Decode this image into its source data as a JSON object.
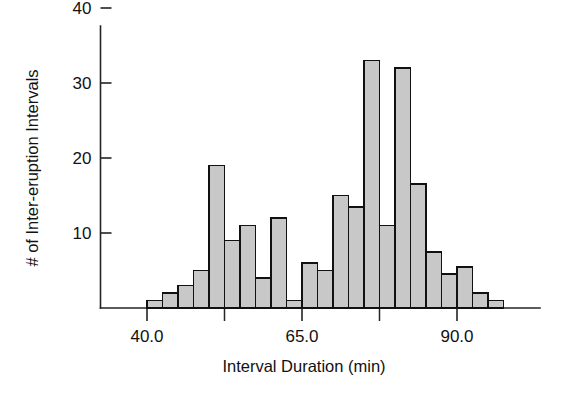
{
  "chart_data": {
    "type": "bar",
    "title": "",
    "subtitle": "",
    "xlabel": "Interval Duration (min)",
    "ylabel": "# of Inter-eruption Intervals",
    "grid": false,
    "legend": null,
    "xlim": [
      37.5,
      100.0
    ],
    "ylim": [
      0,
      43
    ],
    "bin_width": 2.5,
    "x_major_ticks": [
      40.0,
      65.0,
      90.0
    ],
    "x_major_tick_labels": [
      "40.0",
      "65.0",
      "90.0"
    ],
    "x_minor_ticks": [
      52.5,
      77.5
    ],
    "y_ticks": [
      10,
      20,
      30,
      40
    ],
    "y_tick_labels": [
      "10",
      "20",
      "30",
      "40"
    ],
    "bar_fill_color": "#c8c8c8",
    "bar_edge_color": "#111111",
    "axis_color": "#242424",
    "background_color": "#ffffff",
    "bins": [
      {
        "x0": 40.0,
        "x1": 42.5,
        "value": 1
      },
      {
        "x0": 42.5,
        "x1": 45.0,
        "value": 2
      },
      {
        "x0": 45.0,
        "x1": 47.5,
        "value": 3
      },
      {
        "x0": 47.5,
        "x1": 50.0,
        "value": 5
      },
      {
        "x0": 50.0,
        "x1": 52.5,
        "value": 19
      },
      {
        "x0": 52.5,
        "x1": 55.0,
        "value": 9
      },
      {
        "x0": 55.0,
        "x1": 57.5,
        "value": 11
      },
      {
        "x0": 57.5,
        "x1": 60.0,
        "value": 4
      },
      {
        "x0": 60.0,
        "x1": 62.5,
        "value": 12
      },
      {
        "x0": 62.5,
        "x1": 65.0,
        "value": 1
      },
      {
        "x0": 65.0,
        "x1": 67.5,
        "value": 6
      },
      {
        "x0": 67.5,
        "x1": 70.0,
        "value": 5
      },
      {
        "x0": 70.0,
        "x1": 72.5,
        "value": 15
      },
      {
        "x0": 72.5,
        "x1": 75.0,
        "value": 13.5
      },
      {
        "x0": 75.0,
        "x1": 77.5,
        "value": 33
      },
      {
        "x0": 77.5,
        "x1": 80.0,
        "value": 11
      },
      {
        "x0": 80.0,
        "x1": 82.5,
        "value": 32
      },
      {
        "x0": 82.5,
        "x1": 85.0,
        "value": 16.5
      },
      {
        "x0": 85.0,
        "x1": 87.5,
        "value": 7.5
      },
      {
        "x0": 87.5,
        "x1": 90.0,
        "value": 4.5
      },
      {
        "x0": 90.0,
        "x1": 92.5,
        "value": 5.5
      },
      {
        "x0": 92.5,
        "x1": 95.0,
        "value": 2
      },
      {
        "x0": 95.0,
        "x1": 97.5,
        "value": 1
      }
    ]
  }
}
